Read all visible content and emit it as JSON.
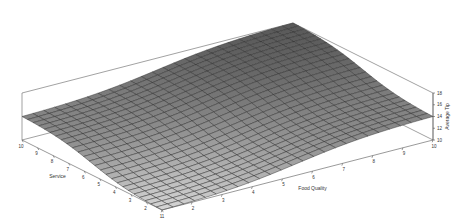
{
  "chart_data": {
    "type": "surface",
    "title": "",
    "xlabel": "Service",
    "ylabel": "Food Quality",
    "zlabel": "Average Tip",
    "x_ticks": [
      1,
      2,
      3,
      4,
      5,
      6,
      7,
      8,
      9,
      10
    ],
    "y_ticks": [
      1,
      2,
      3,
      4,
      5,
      6,
      7,
      8,
      9,
      10
    ],
    "z_ticks": [
      10,
      12,
      14,
      16,
      18
    ],
    "x_tick_labels": [
      "1",
      "2",
      "3",
      "4",
      "5",
      "6",
      "7",
      "8",
      "9",
      "10"
    ],
    "y_tick_labels": [
      "1",
      "2",
      "3",
      "4",
      "5",
      "6",
      "7",
      "8",
      "9",
      "10"
    ],
    "z_tick_labels": [
      "10",
      "12",
      "14",
      "16",
      "18"
    ],
    "xlim": [
      1,
      10
    ],
    "ylim": [
      1,
      10
    ],
    "zlim": [
      10,
      18
    ],
    "grid": false,
    "legend": "none",
    "surface_description": "Smooth sigmoid surface: minimum ~10 at Service=1, Food Quality=1; ~14 at the mixed corners (Service=10,Food=1) and (Service=1,Food=10); maximum ~18 at Service=10, Food Quality=10",
    "corner_values": {
      "service_1_food_1": 10,
      "service_10_food_1": 14,
      "service_1_food_10": 14,
      "service_10_food_10": 18
    },
    "mesh_resolution": 25,
    "colors": {
      "surface_dark": "#5a5a5a",
      "surface_light": "#d8d8d8",
      "mesh": "#2a2a2a",
      "box": "#7a7a7a"
    }
  }
}
